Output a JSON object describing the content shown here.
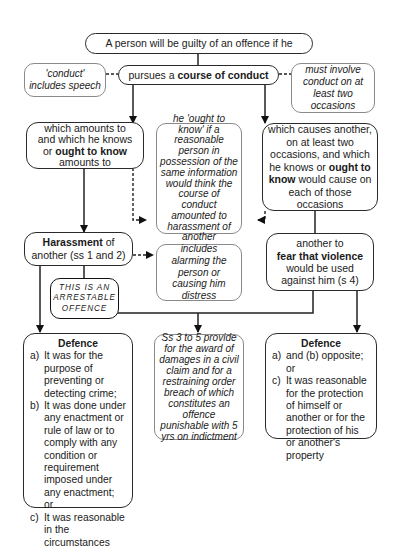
{
  "top": {
    "text": "A person will be guilty of an offence if he"
  },
  "conduct": {
    "pre": "pursues a ",
    "bold": "course of conduct"
  },
  "note_left": {
    "text": "'conduct' includes speech"
  },
  "note_right": {
    "text": "must involve conduct on at least two occasions"
  },
  "left_branch": {
    "l1": "which amounts to",
    "l2": "and which he knows",
    "l3_pre": "or ",
    "l3_bold": "ought to know",
    "l4": "amounts to"
  },
  "middle_note": {
    "text": "he 'ought to know' if a reasonable person in possession of the same information would think the course of conduct amounted to harassment of another"
  },
  "right_branch": {
    "l1": "which causes another, on at least two occasions, and which he knows or ",
    "bold": "ought to know",
    "l2": " would cause on each of those occasions"
  },
  "harassment": {
    "bold": "Harassment",
    "rest1": " of",
    "rest2": "another (ss 1 and 2)"
  },
  "includes_note": {
    "text": "includes alarming the person or causing him distress"
  },
  "fear": {
    "l1": "another to",
    "bold": "fear that violence",
    "l2": "would be used",
    "l3": "against him (s 4)"
  },
  "arrestable": {
    "l1": "THIS IS AN",
    "l2": "ARRESTABLE",
    "l3": "OFFENCE"
  },
  "remedies_note": {
    "text": "Ss 3 to 5 provide for the award of damages in a civil claim and for a restraining order breach of which constitutes an offence punishable with 5 yrs on indictment"
  },
  "defence_left": {
    "title": "Defence",
    "items": [
      {
        "label": "a)",
        "text": "It was for the purpose of preventing or detecting crime;"
      },
      {
        "label": "b)",
        "text": "It was done under any enactment or rule of law or to comply with any condition or requirement imposed under any enactment; or"
      },
      {
        "label": "c)",
        "text": "It was reasonable in the circumstances"
      }
    ]
  },
  "defence_right": {
    "title": "Defence",
    "items": [
      {
        "label": "a)",
        "text": "and (b) opposite; or"
      },
      {
        "label": "c)",
        "text": "It was reasonable for the protection of himself or another or for the protection of his or another's property"
      }
    ]
  }
}
